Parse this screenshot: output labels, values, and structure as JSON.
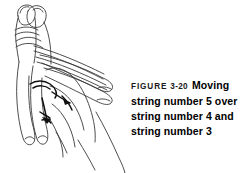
{
  "figure": {
    "label": "FIGURE",
    "number": "3-20",
    "caption_lines": [
      "Moving",
      "string number 5 over",
      "string number 4 and",
      "string number 3"
    ],
    "caption_full": "FIGURE 3-20 Moving string number 5 over string number 4 and string number 3"
  },
  "illustration": {
    "alt": "Line drawing of a hand with string figure loops; a string is being moved over other strings",
    "ink_color": "#333333",
    "accent_color": "#000000",
    "background_color": "#ffffff"
  }
}
